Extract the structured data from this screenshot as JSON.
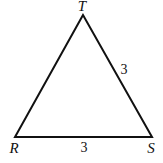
{
  "diagram": {
    "type": "triangle",
    "vertices": [
      {
        "name": "T",
        "x": 83,
        "y": 15
      },
      {
        "name": "R",
        "x": 15,
        "y": 137
      },
      {
        "name": "S",
        "x": 152,
        "y": 137
      }
    ],
    "vertex_labels": {
      "T": "T",
      "R": "R",
      "S": "S"
    },
    "side_labels": {
      "TS": "3",
      "RS": "3"
    },
    "stroke_color": "#111111",
    "background": "#ffffff"
  }
}
